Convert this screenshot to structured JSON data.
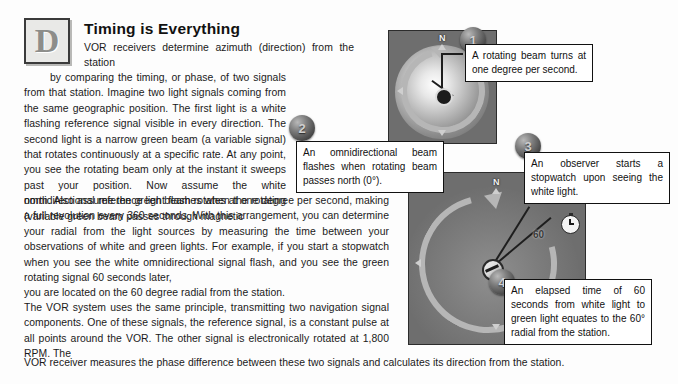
{
  "document": {
    "heading": "Timing is Everything",
    "dropcap_letter": "D",
    "paragraphs": {
      "p1_lead": "VOR receivers determine azimuth (direction) from the station",
      "p1_rest": "by comparing the timing, or phase, of two signals from that station. Imagine two light signals coming from the same geographic position. The first light is a white flashing reference signal visible in every direction. The second light is a narrow green beam (a variable signal) that rotates continuously at a specific rate. At any point, you see the rotating beam only at the instant it sweeps past your position. Now assume the white omnidirectional reference light flashes when the rotating (variable green beam passes through magnetic",
      "p1_cont": "north. Also assume the green beam rotates at one degree per second, making a full revolution every 360 seconds. With this arrangement, you can determine your radial from the light sources by measuring the time between your observations of white and green lights. For example, if you start a stopwatch when you see the white omnidirectional signal flash, and you see the green rotating signal 60 seconds later,",
      "p1_last": "you are located on the 60 degree radial from the station.",
      "p2": "The VOR system uses the same principle, transmitting two navigation signal components. One of these signals, the reference signal, is a constant pulse at all points around the VOR. The other signal is electronically rotated at 1,800 RPM. The",
      "p2_last": "VOR receiver measures the phase difference between these two signals and calculates its direction from the station."
    }
  },
  "badges": {
    "one": "1",
    "two": "2",
    "three": "3",
    "four": "4"
  },
  "callouts": {
    "c1": "A rotating beam turns at one degree per second.",
    "c2": "An omnidirectional beam flashes when rotating beam passes north (0°).",
    "c3": "An observer starts a stopwatch upon seeing the white light.",
    "c4": "An elapsed time of 60 seconds from white light to green light equates to the 60° radial from the station."
  },
  "diagrams": {
    "top": {
      "north_label": "N"
    },
    "bottom": {
      "north_label": "N",
      "degree_label": "60"
    }
  },
  "colors": {
    "panel_background": "#6e6e6e",
    "panel_border": "#2c2c2c",
    "ring": "#b6b6b6",
    "callout_border": "#111111",
    "text": "#1a1a1a",
    "page_background": "#fdfdfd"
  }
}
